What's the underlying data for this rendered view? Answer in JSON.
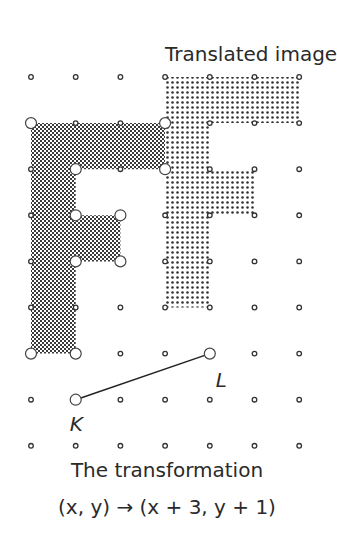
{
  "title": "Translated image",
  "caption": {
    "line1": "The transformation",
    "line2": "(x, y) → (x + 3, y + 1)"
  },
  "points": {
    "K": {
      "label": "K",
      "grid": [
        1,
        1
      ]
    },
    "L": {
      "label": "L",
      "grid": [
        4,
        2
      ]
    }
  },
  "grid": {
    "columns": 7,
    "rows": 9,
    "x0": 31,
    "dx": 44.7,
    "y0": 77,
    "dy": 46.1
  },
  "original_figure": {
    "name": "F",
    "vertices": [
      [
        0,
        7
      ],
      [
        3,
        7
      ],
      [
        3,
        6
      ],
      [
        1,
        6
      ],
      [
        1,
        5
      ],
      [
        2,
        5
      ],
      [
        2,
        4
      ],
      [
        1,
        4
      ],
      [
        1,
        2
      ],
      [
        0,
        2
      ]
    ]
  },
  "translated_figure": {
    "name": "F'",
    "vertices": [
      [
        3,
        8
      ],
      [
        6,
        8
      ],
      [
        6,
        7
      ],
      [
        4,
        7
      ],
      [
        4,
        6
      ],
      [
        5,
        6
      ],
      [
        5,
        5
      ],
      [
        4,
        5
      ],
      [
        4,
        3
      ],
      [
        3,
        3
      ]
    ]
  },
  "translation": {
    "dx": 3,
    "dy": 1
  }
}
